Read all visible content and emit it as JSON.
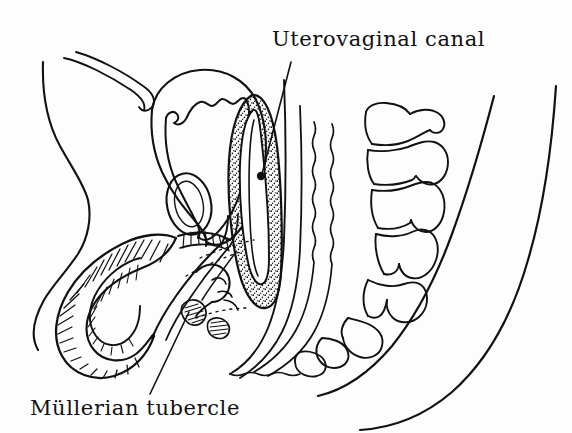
{
  "figure": {
    "type": "anatomical-line-drawing",
    "style": "black ink line art on white background, hand-lettered labels",
    "background_color": "#fdfdfd",
    "ink_color": "#111111",
    "width": 572,
    "height": 433
  },
  "labels": [
    {
      "id": "uterovaginal-canal",
      "text": "Uterovaginal canal",
      "position": "top-right",
      "leader_line": {
        "from_x": 291,
        "from_y": 62,
        "to_x": 262,
        "to_y": 174,
        "terminator": "filled-dot"
      }
    },
    {
      "id": "mullerian-tubercle",
      "text": "Müllerian tubercle",
      "position": "bottom-left",
      "leader_line": {
        "from_x": 150,
        "from_y": 394,
        "to_x": 189,
        "to_y": 312,
        "terminator": "none"
      }
    }
  ],
  "structures": [
    {
      "name": "umbilical-cord-stalk",
      "region": "upper-left"
    },
    {
      "name": "anterior-abdominal-wall",
      "region": "left"
    },
    {
      "name": "urinary-bladder",
      "region": "upper-center-left"
    },
    {
      "name": "pubic-symphysis",
      "region": "center-left"
    },
    {
      "name": "phallus-penis",
      "region": "lower-left",
      "shading": "hatched"
    },
    {
      "name": "uterovaginal-canal",
      "region": "center",
      "shading": "stippled"
    },
    {
      "name": "mullerian-tubercle",
      "region": "lower-center",
      "shading": "hatched"
    },
    {
      "name": "rectum-anal-canal",
      "region": "center-right",
      "shading": "wavy-lines"
    },
    {
      "name": "vertebral-column",
      "region": "right"
    },
    {
      "name": "sacrum-coccyx",
      "region": "lower-right"
    },
    {
      "name": "body-contour-buttock",
      "region": "far-right"
    }
  ]
}
